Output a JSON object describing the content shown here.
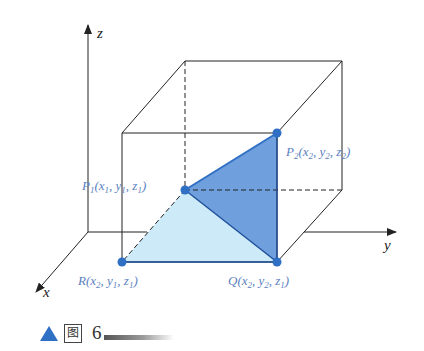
{
  "figure": {
    "axes": {
      "x_label": "x",
      "y_label": "y",
      "z_label": "z"
    },
    "points": {
      "P1": {
        "name": "P",
        "sub": "1",
        "coords": "(x",
        "c1": "1",
        "sep1": ", y",
        "c2": "1",
        "sep2": ", z",
        "c3": "1",
        "end": ")"
      },
      "P2": {
        "name": "P",
        "sub": "2",
        "coords": "(x",
        "c1": "2",
        "sep1": ", y",
        "c2": "2",
        "sep2": ", z",
        "c3": "2",
        "end": ")"
      },
      "R": {
        "name": "R",
        "sub": "",
        "coords": "(x",
        "c1": "2",
        "sep1": ", y",
        "c2": "1",
        "sep2": ", z",
        "c3": "1",
        "end": ")"
      },
      "Q": {
        "name": "Q",
        "sub": "",
        "coords": "(x",
        "c1": "2",
        "sep1": ", y",
        "c2": "2",
        "sep2": ", z",
        "c3": "1",
        "end": ")"
      }
    },
    "colors": {
      "dark_triangle": "#6f9fdc",
      "light_triangle": "#cdeaf8",
      "point": "#2f6fc4",
      "label": "#5b7fc0"
    }
  },
  "caption": {
    "icon": "triangle-up-icon",
    "word": "图",
    "number": "6"
  }
}
